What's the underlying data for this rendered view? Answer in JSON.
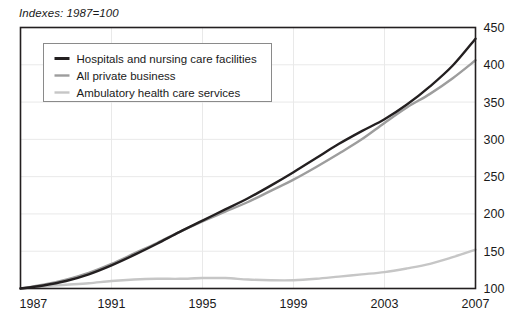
{
  "chart_data": {
    "type": "line",
    "title": "",
    "subtitle": "Indexes: 1987=100",
    "xlabel": "",
    "ylabel": "",
    "xlim": [
      1987,
      2007
    ],
    "ylim": [
      100,
      450
    ],
    "ytick_step": 50,
    "yticks": [
      100,
      150,
      200,
      250,
      300,
      350,
      400,
      450
    ],
    "xticks": [
      1987,
      1991,
      1995,
      1999,
      2003,
      2007
    ],
    "x": [
      1987,
      1988,
      1989,
      1990,
      1991,
      1992,
      1993,
      1994,
      1995,
      1996,
      1997,
      1998,
      1999,
      2000,
      2001,
      2002,
      2003,
      2004,
      2005,
      2006,
      2007
    ],
    "grid": "both",
    "legend_position": "upper-left-inside",
    "series": [
      {
        "name": "Hospitals and nursing care facilities",
        "color": "#231f20",
        "width": 2.4,
        "values": [
          100,
          104,
          110,
          119,
          131,
          145,
          160,
          176,
          191,
          206,
          221,
          238,
          256,
          275,
          294,
          311,
          327,
          347,
          371,
          399,
          435
        ]
      },
      {
        "name": "All private business",
        "color": "#9d9d9d",
        "width": 2.4,
        "values": [
          100,
          105,
          112,
          121,
          133,
          147,
          161,
          176,
          190,
          203,
          216,
          231,
          246,
          263,
          281,
          300,
          322,
          343,
          361,
          382,
          406
        ]
      },
      {
        "name": "Ambulatory health care services",
        "color": "#c6c6c6",
        "width": 2.4,
        "values": [
          100,
          103,
          105,
          107,
          110,
          112,
          113,
          113,
          114,
          114,
          112,
          111,
          111,
          113,
          116,
          119,
          122,
          127,
          133,
          142,
          152
        ]
      }
    ]
  },
  "legend": {
    "items": [
      {
        "label": "Hospitals and nursing care facilities",
        "color": "#231f20"
      },
      {
        "label": "All private business",
        "color": "#9d9d9d"
      },
      {
        "label": "Ambulatory health care services",
        "color": "#c6c6c6"
      }
    ]
  },
  "axes": {
    "frame_color": "#231f20",
    "grid_color": "#e9e9e9"
  }
}
